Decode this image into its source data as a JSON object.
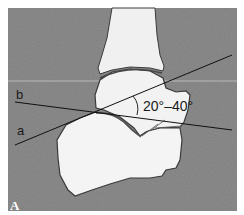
{
  "figure": {
    "panel_label": "A",
    "line_labels": {
      "a": "a",
      "b": "b"
    },
    "angle_label": "20°–40°"
  },
  "colors": {
    "background": "#8a8a8a",
    "bone": "#f2f2f2",
    "outline": "#333333",
    "line": "#111111",
    "frame": "#ffffff"
  }
}
